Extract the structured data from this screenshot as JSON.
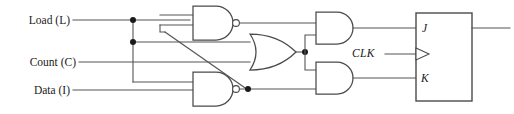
{
  "diagram": {
    "background_color": "#ffffff",
    "wire_color": "#555555",
    "gate_color": "#4a4a4a",
    "dot_color": "#1a1a1a",
    "inputs": [
      {
        "id": "load",
        "label": "Load (L)"
      },
      {
        "id": "count",
        "label": "Count (C)"
      },
      {
        "id": "data",
        "label": "Data (I)"
      }
    ],
    "clock": {
      "label": "CLK"
    },
    "flipflop": {
      "type": "JK",
      "pins": [
        {
          "id": "j",
          "label": "J"
        },
        {
          "id": "clk",
          "label": ""
        },
        {
          "id": "k",
          "label": "K"
        }
      ]
    },
    "gates": [
      {
        "id": "nand-top",
        "type": "NAND",
        "inverted": true
      },
      {
        "id": "nand-bottom",
        "type": "NAND",
        "inverted": true
      },
      {
        "id": "or-gate",
        "type": "OR",
        "inverted": false
      },
      {
        "id": "and-top",
        "type": "AND",
        "inverted": false
      },
      {
        "id": "and-bottom",
        "type": "AND",
        "inverted": false
      }
    ]
  }
}
